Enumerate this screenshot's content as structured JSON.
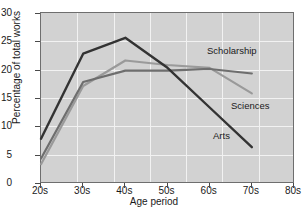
{
  "chart_data": {
    "type": "line",
    "title": "",
    "xlabel": "Age period",
    "ylabel": "Percentage of total works",
    "x": [
      "20s",
      "30s",
      "40s",
      "50s",
      "60s",
      "70s",
      "80s"
    ],
    "xlim": [
      20,
      80
    ],
    "ylim": [
      0,
      30
    ],
    "yticks": [
      0,
      5,
      10,
      15,
      20,
      25,
      30
    ],
    "grid": true,
    "legend_position": "inline-annotations",
    "series": [
      {
        "name": "Arts",
        "color": "#333333",
        "x": [
          "20s",
          "30s",
          "40s",
          "50s",
          "60s",
          "70s"
        ],
        "values": [
          8,
          23,
          25.8,
          20.5,
          13.5,
          6.5
        ]
      },
      {
        "name": "Scholarship",
        "color": "#6e6e6e",
        "x": [
          "20s",
          "30s",
          "40s",
          "50s",
          "60s",
          "70s"
        ],
        "values": [
          4.5,
          18,
          20,
          20,
          20.3,
          19.5
        ]
      },
      {
        "name": "Sciences",
        "color": "#9a9a9a",
        "x": [
          "20s",
          "30s",
          "40s",
          "50s",
          "60s",
          "70s"
        ],
        "values": [
          3.5,
          17.3,
          21.8,
          21,
          20.5,
          16
        ]
      }
    ],
    "annotations": [
      {
        "text": "Scholarship",
        "x_px": 206,
        "y_px": 44
      },
      {
        "text": "Sciences",
        "x_px": 230,
        "y_px": 99
      },
      {
        "text": "Arts",
        "x_px": 212,
        "y_px": 129
      }
    ]
  },
  "colors": {
    "plot_background": "#d2d2d2",
    "grid": "#f2f2f2",
    "axis": "#4a4a4a",
    "text": "#1a1a1a"
  }
}
